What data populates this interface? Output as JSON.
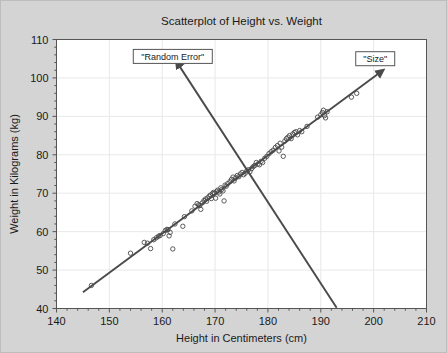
{
  "chart_data": {
    "type": "scatter",
    "title": "Scatterplot of Height vs. Weight",
    "xlabel": "Height in Centimeters (cm)",
    "ylabel": "Weight in Kilograms (kg)",
    "xlim": [
      140,
      210
    ],
    "ylim": [
      40,
      110
    ],
    "xticks": [
      140,
      150,
      160,
      170,
      180,
      190,
      200,
      210
    ],
    "yticks": [
      40,
      50,
      60,
      70,
      80,
      90,
      100,
      110
    ],
    "x_minor_step": 2,
    "y_minor_step": 2,
    "grid": true,
    "legend": "none",
    "marker": "open-circle",
    "marker_color": "#4a4a4a",
    "plot_bg": "#ffffff",
    "figure_bg": "#d4d4d4",
    "points": [
      [
        146.6,
        46.0
      ],
      [
        154.0,
        54.4
      ],
      [
        156.6,
        57.2
      ],
      [
        157.2,
        57.0
      ],
      [
        157.8,
        55.6
      ],
      [
        158.4,
        57.9
      ],
      [
        158.9,
        58.4
      ],
      [
        159.3,
        58.8
      ],
      [
        159.6,
        59.0
      ],
      [
        160.2,
        59.5
      ],
      [
        160.6,
        60.3
      ],
      [
        160.9,
        60.6
      ],
      [
        161.1,
        60.5
      ],
      [
        161.3,
        58.9
      ],
      [
        161.5,
        59.8
      ],
      [
        162.0,
        55.5
      ],
      [
        162.4,
        62.0
      ],
      [
        163.9,
        61.4
      ],
      [
        164.2,
        63.9
      ],
      [
        165.6,
        65.4
      ],
      [
        166.2,
        66.6
      ],
      [
        166.6,
        67.3
      ],
      [
        166.9,
        67.0
      ],
      [
        167.1,
        66.8
      ],
      [
        167.3,
        65.8
      ],
      [
        167.6,
        67.5
      ],
      [
        167.9,
        68.1
      ],
      [
        168.2,
        68.5
      ],
      [
        168.4,
        67.9
      ],
      [
        168.6,
        68.8
      ],
      [
        168.9,
        69.2
      ],
      [
        169.1,
        69.5
      ],
      [
        169.3,
        68.6
      ],
      [
        169.5,
        69.9
      ],
      [
        169.7,
        70.2
      ],
      [
        169.9,
        70.0
      ],
      [
        170.1,
        68.7
      ],
      [
        170.3,
        70.5
      ],
      [
        170.5,
        70.8
      ],
      [
        170.7,
        70.3
      ],
      [
        170.9,
        69.8
      ],
      [
        171.1,
        71.4
      ],
      [
        171.3,
        71.0
      ],
      [
        171.5,
        70.6
      ],
      [
        171.7,
        68.0
      ],
      [
        171.9,
        72.1
      ],
      [
        172.1,
        71.8
      ],
      [
        172.4,
        72.5
      ],
      [
        172.8,
        73.0
      ],
      [
        173.1,
        73.6
      ],
      [
        173.4,
        74.2
      ],
      [
        173.6,
        73.2
      ],
      [
        173.9,
        74.0
      ],
      [
        174.2,
        74.6
      ],
      [
        174.5,
        74.3
      ],
      [
        174.8,
        75.0
      ],
      [
        175.1,
        75.4
      ],
      [
        175.4,
        74.8
      ],
      [
        175.7,
        75.2
      ],
      [
        176.0,
        75.8
      ],
      [
        176.3,
        76.1
      ],
      [
        176.6,
        75.6
      ],
      [
        176.9,
        76.4
      ],
      [
        177.2,
        76.9
      ],
      [
        177.5,
        77.2
      ],
      [
        177.8,
        78.0
      ],
      [
        178.1,
        77.6
      ],
      [
        178.4,
        77.4
      ],
      [
        178.7,
        78.3
      ],
      [
        179.0,
        78.0
      ],
      [
        179.4,
        79.1
      ],
      [
        179.8,
        79.6
      ],
      [
        180.2,
        80.3
      ],
      [
        180.6,
        80.8
      ],
      [
        181.0,
        81.2
      ],
      [
        181.4,
        81.9
      ],
      [
        181.8,
        82.4
      ],
      [
        182.1,
        81.0
      ],
      [
        182.3,
        83.0
      ],
      [
        182.6,
        82.0
      ],
      [
        182.9,
        79.6
      ],
      [
        183.2,
        83.6
      ],
      [
        183.5,
        84.2
      ],
      [
        183.8,
        84.6
      ],
      [
        184.1,
        85.0
      ],
      [
        184.4,
        84.2
      ],
      [
        184.7,
        85.4
      ],
      [
        185.0,
        85.8
      ],
      [
        185.3,
        86.0
      ],
      [
        185.6,
        85.2
      ],
      [
        186.0,
        86.3
      ],
      [
        186.4,
        86.0
      ],
      [
        187.4,
        87.4
      ],
      [
        189.4,
        89.8
      ],
      [
        190.0,
        90.4
      ],
      [
        190.3,
        91.0
      ],
      [
        190.5,
        91.6
      ],
      [
        190.7,
        90.2
      ],
      [
        190.9,
        89.6
      ],
      [
        191.2,
        91.2
      ],
      [
        195.8,
        95.0
      ],
      [
        196.8,
        96.0
      ]
    ],
    "trend_line": {
      "label": "\"Size\"",
      "from": [
        145.0,
        44.2
      ],
      "to": [
        201.0,
        101.2
      ],
      "color": "#4a4a4a",
      "arrow": "end"
    },
    "error_line": {
      "label": "\"Random Error\"",
      "from": [
        193.0,
        40.2
      ],
      "to": [
        163.2,
        103.2
      ],
      "color": "#4a4a4a",
      "arrow": "end"
    },
    "annotations": [
      {
        "name": "random-error",
        "text": "\"Random Error\"",
        "x": 162.0,
        "y": 105.6
      },
      {
        "name": "size",
        "text": "\"Size\"",
        "x": 200.3,
        "y": 105.0
      }
    ]
  }
}
